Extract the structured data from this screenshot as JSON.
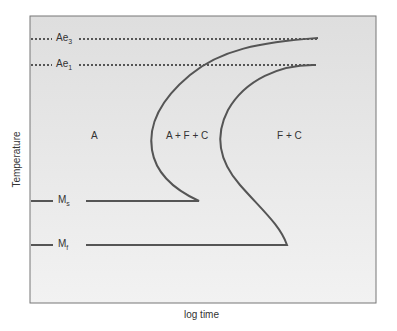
{
  "diagram": {
    "type": "TTT (time-temperature-transformation) diagram",
    "xlabel": "log time",
    "ylabel": "Temperature",
    "lines": {
      "ae3": {
        "label": "Ae",
        "sub": "3"
      },
      "ae1": {
        "label": "Ae",
        "sub": "1"
      },
      "ms": {
        "label": "M",
        "sub": "s"
      },
      "mf": {
        "label": "M",
        "sub": "f"
      }
    },
    "regions": {
      "austenite": "A",
      "transforming": "A + F + C",
      "transformed": "F + C"
    },
    "colors": {
      "plot_bg": "#e4e4e4",
      "frame": "#777777",
      "curve": "#555555"
    }
  }
}
